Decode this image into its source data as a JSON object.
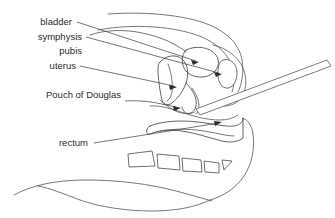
{
  "figure": {
    "type": "anatomical-line-diagram",
    "background_color": "#ffffff",
    "line_color": "#555555",
    "text_color": "#2b2b2b",
    "width": 335,
    "height": 218
  },
  "labels": [
    {
      "id": "bladder",
      "text": "bladder",
      "x": 72,
      "y": 25,
      "anchor": "end",
      "leader_from": [
        77,
        22
      ],
      "leader_to": [
        198,
        61
      ],
      "arrow": true,
      "arrow_angle": 18
    },
    {
      "id": "symphysis",
      "text": "symphysis",
      "x": 82,
      "y": 40,
      "anchor": "end",
      "leader_from": [
        86,
        37
      ],
      "leader_to": [
        221,
        74
      ],
      "arrow": true,
      "arrow_angle": 15
    },
    {
      "id": "pubis",
      "text": "pubis",
      "x": 82,
      "y": 54,
      "anchor": "end",
      "leader_from": null,
      "leader_to": null,
      "arrow": false,
      "arrow_angle": 0
    },
    {
      "id": "uterus",
      "text": "uterus",
      "x": 76,
      "y": 69,
      "anchor": "end",
      "leader_from": [
        80,
        66
      ],
      "leader_to": [
        176,
        87
      ],
      "arrow": true,
      "arrow_angle": 12
    },
    {
      "id": "pouch-of-douglas",
      "text": "Pouch of Douglas",
      "x": 121,
      "y": 98,
      "anchor": "end",
      "leader_from": [
        125,
        101
      ],
      "leader_to": [
        180,
        108
      ],
      "arrow": true,
      "arrow_angle": 6
    },
    {
      "id": "rectum",
      "text": "rectum",
      "x": 88,
      "y": 146,
      "anchor": "end",
      "leader_from": [
        94,
        143
      ],
      "leader_to": [
        222,
        123
      ],
      "arrow": true,
      "arrow_angle": -9
    }
  ],
  "structures": [
    {
      "id": "abdominal-wall-outline",
      "name": "abdominal wall"
    },
    {
      "id": "bladder-outline",
      "name": "bladder"
    },
    {
      "id": "symphysis-pubis-bone",
      "name": "symphysis pubis"
    },
    {
      "id": "uterus-outline",
      "name": "uterus"
    },
    {
      "id": "vagina-outline",
      "name": "vagina"
    },
    {
      "id": "pouch-of-douglas-outline",
      "name": "pouch of Douglas"
    },
    {
      "id": "rectum-outline",
      "name": "rectum"
    },
    {
      "id": "sacrum-vertebrae",
      "name": "sacral vertebrae",
      "count": 4
    },
    {
      "id": "coccyx-tip",
      "name": "coccyx"
    },
    {
      "id": "buttock-outline",
      "name": "buttock"
    },
    {
      "id": "thigh-outline",
      "name": "thigh"
    },
    {
      "id": "instrument-rod",
      "name": "instrument"
    }
  ]
}
